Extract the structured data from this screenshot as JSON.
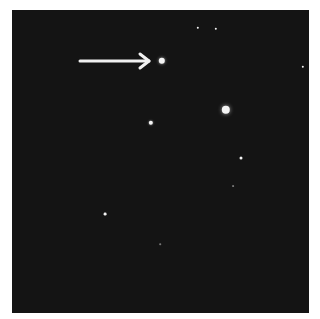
{
  "image": {
    "description": "Astronomical photograph of a star field with an arrow pointing to a star",
    "background_color": "#141414",
    "arrow": {
      "x1": 80,
      "y1": 61,
      "x2": 149,
      "y2": 61,
      "color": "#f0f0f0"
    },
    "stars": [
      {
        "x": 162,
        "y": 61,
        "r": 3.2,
        "role": "target"
      },
      {
        "x": 226,
        "y": 110,
        "r": 4.2
      },
      {
        "x": 151,
        "y": 123,
        "r": 2.2
      },
      {
        "x": 241,
        "y": 158,
        "r": 1.5
      },
      {
        "x": 198,
        "y": 28,
        "r": 1.2
      },
      {
        "x": 216,
        "y": 29,
        "r": 1.2
      },
      {
        "x": 303,
        "y": 67,
        "r": 1.2
      },
      {
        "x": 105,
        "y": 214,
        "r": 1.4
      },
      {
        "x": 233,
        "y": 186,
        "r": 0.9
      },
      {
        "x": 160,
        "y": 244,
        "r": 0.8
      }
    ]
  }
}
